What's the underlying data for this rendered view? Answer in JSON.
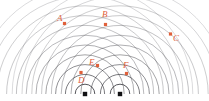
{
  "figure": {
    "background_color": "#ffffff",
    "width": 209,
    "height": 101
  },
  "colors": {
    "wavefront": "#3a3a40",
    "source": "#111114",
    "marker": "#e0603a"
  },
  "sources": [
    {
      "name": "left-source",
      "label": "",
      "x": 85,
      "y": 94,
      "radius": 2.2
    },
    {
      "name": "right-source",
      "label": "",
      "x": 120,
      "y": 94,
      "radius": 2.2
    }
  ],
  "wave": {
    "ring_spacing": 9.8,
    "ring_count": 11,
    "stroke_widths": [
      0.95,
      0.8,
      0.7,
      0.62,
      0.58,
      0.55,
      0.52,
      0.5,
      0.5,
      0.48,
      0.46
    ]
  },
  "markers": [
    {
      "label": "A",
      "dot_x": 64.5,
      "dot_y": 23.5,
      "label_x": 57,
      "label_y": 21
    },
    {
      "label": "B",
      "dot_x": 105.5,
      "dot_y": 24.5,
      "label_x": 102,
      "label_y": 17
    },
    {
      "label": "C",
      "dot_x": 170.5,
      "dot_y": 34.0,
      "label_x": 173,
      "label_y": 41
    },
    {
      "label": "D",
      "dot_x": 81.0,
      "dot_y": 72.5,
      "label_x": 78,
      "label_y": 83
    },
    {
      "label": "E",
      "dot_x": 97.5,
      "dot_y": 65.5,
      "label_x": 89,
      "label_y": 65
    },
    {
      "label": "F",
      "dot_x": 126.5,
      "dot_y": 73.5,
      "label_x": 123,
      "label_y": 68
    }
  ],
  "chart_data": {
    "type": "scatter",
    "xlabel": "",
    "ylabel": "",
    "xlim": [
      0,
      209
    ],
    "ylim": [
      0,
      101
    ],
    "grid": false,
    "legend_position": "none",
    "series": [
      {
        "name": "sources",
        "marker": "filled-square",
        "color": "#111114",
        "points": [
          {
            "label": "",
            "x": 85,
            "y": 94
          },
          {
            "label": "",
            "x": 120,
            "y": 94
          }
        ]
      },
      {
        "name": "labelled-points",
        "marker": "filled-square",
        "color": "#e0603a",
        "points": [
          {
            "label": "A",
            "x": 64.5,
            "y": 23.5
          },
          {
            "label": "B",
            "x": 105.5,
            "y": 24.5
          },
          {
            "label": "C",
            "x": 170.5,
            "y": 34.0
          },
          {
            "label": "D",
            "x": 81.0,
            "y": 72.5
          },
          {
            "label": "E",
            "x": 97.5,
            "y": 65.5
          },
          {
            "label": "F",
            "x": 126.5,
            "y": 73.5
          }
        ]
      }
    ],
    "annotations": [
      {
        "text": "A",
        "x": 57,
        "y": 21
      },
      {
        "text": "B",
        "x": 102,
        "y": 17
      },
      {
        "text": "C",
        "x": 173,
        "y": 41
      },
      {
        "text": "D",
        "x": 78,
        "y": 83
      },
      {
        "text": "E",
        "x": 89,
        "y": 65
      },
      {
        "text": "F",
        "x": 123,
        "y": 68
      }
    ]
  }
}
